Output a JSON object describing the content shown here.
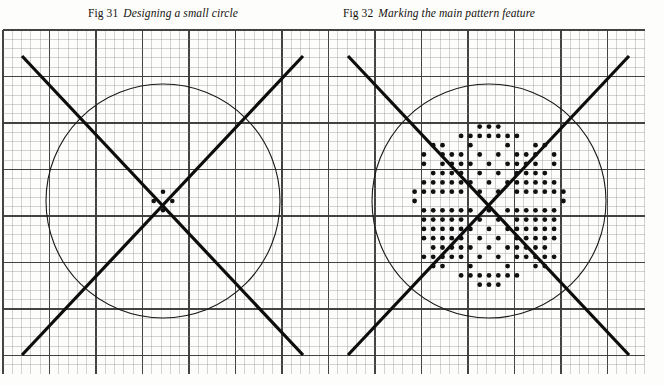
{
  "page": {
    "background_color": "#fdfdfb",
    "ink_color": "#15120f",
    "grid_line_color": "#3a3a3a",
    "grid_minor_color": "#8a8a8a",
    "circle_color": "#1a1a1a",
    "dot_color": "#101010",
    "diagonal_color": "#0d0d0d"
  },
  "captions": [
    {
      "id": "fig31",
      "label": "Fig 31",
      "title": "Designing a small circle"
    },
    {
      "id": "fig32",
      "label": "Fig 32",
      "title": "Marking the main pattern feature"
    }
  ],
  "grid": {
    "origin_x": 3,
    "origin_y": 8,
    "cell": 9.3,
    "cols": 69,
    "rows": 39,
    "major_every": 5,
    "minor_width": 0.5,
    "major_width": 1.15
  },
  "figures": [
    {
      "name": "fig31-small-circle",
      "center_x": 163,
      "center_y": 179,
      "circle_radius": 117,
      "circle_stroke": 1.1,
      "diagonals": [
        {
          "x1": 22,
          "y1": 34,
          "x2": 303,
          "y2": 333
        },
        {
          "x1": 303,
          "y1": 34,
          "x2": 22,
          "y2": 333
        }
      ],
      "diagonal_width": 3.2,
      "center_dots": [
        {
          "dx": 0,
          "dy": -9.3
        },
        {
          "dx": 0,
          "dy": 9.3
        },
        {
          "dx": -9.3,
          "dy": 0
        },
        {
          "dx": 9.3,
          "dy": 0
        }
      ],
      "dot_radius": 2.3
    },
    {
      "name": "fig32-main-pattern",
      "center_x": 489,
      "center_y": 179,
      "circle_radius": 117,
      "circle_stroke": 1.1,
      "diagonals": [
        {
          "x1": 348,
          "y1": 34,
          "x2": 629,
          "y2": 333
        },
        {
          "x1": 629,
          "y1": 34,
          "x2": 348,
          "y2": 333
        }
      ],
      "diagonal_width": 3.2,
      "dot_radius": 2.4,
      "pattern_dots_grid": [
        [
          0,
          -8
        ],
        [
          1,
          -8
        ],
        [
          -1,
          -7
        ],
        [
          0,
          -7
        ],
        [
          2,
          -7
        ],
        [
          3,
          -7
        ],
        [
          -2,
          -6
        ],
        [
          -6,
          -6
        ],
        [
          5,
          -6
        ],
        [
          6,
          -6
        ],
        [
          -3,
          -5
        ],
        [
          -1,
          -5
        ],
        [
          1,
          -5
        ],
        [
          4,
          -5
        ],
        [
          7,
          -5
        ],
        [
          -5,
          -5
        ],
        [
          -4,
          -4
        ],
        [
          -2,
          -4
        ],
        [
          0,
          -4
        ],
        [
          2,
          -4
        ],
        [
          3,
          -4
        ],
        [
          5,
          -4
        ],
        [
          7,
          -4
        ],
        [
          -7,
          -4
        ],
        [
          -5,
          -3
        ],
        [
          -3,
          -3
        ],
        [
          -1,
          -3
        ],
        [
          1,
          -3
        ],
        [
          4,
          -3
        ],
        [
          6,
          -3
        ],
        [
          -6,
          -2
        ],
        [
          -4,
          -2
        ],
        [
          -2,
          -2
        ],
        [
          0,
          -2
        ],
        [
          2,
          -2
        ],
        [
          3,
          -2
        ],
        [
          5,
          -2
        ],
        [
          7,
          -2
        ],
        [
          -7,
          -1
        ],
        [
          -5,
          -1
        ],
        [
          -3,
          -1
        ],
        [
          -1,
          -1
        ],
        [
          1,
          -1
        ],
        [
          4,
          -1
        ],
        [
          6,
          -1
        ],
        [
          -8,
          0
        ],
        [
          -8,
          -1
        ],
        [
          8,
          0
        ],
        [
          8,
          -1
        ],
        [
          -6,
          1
        ],
        [
          -4,
          1
        ],
        [
          -2,
          1
        ],
        [
          0,
          1
        ],
        [
          2,
          1
        ],
        [
          3,
          1
        ],
        [
          5,
          1
        ],
        [
          7,
          1
        ],
        [
          -7,
          2
        ],
        [
          -5,
          2
        ],
        [
          -3,
          2
        ],
        [
          -1,
          2
        ],
        [
          1,
          2
        ],
        [
          4,
          2
        ],
        [
          6,
          2
        ],
        [
          -6,
          3
        ],
        [
          -4,
          3
        ],
        [
          -2,
          3
        ],
        [
          0,
          3
        ],
        [
          2,
          3
        ],
        [
          3,
          3
        ],
        [
          5,
          3
        ],
        [
          7,
          3
        ],
        [
          -7,
          4
        ],
        [
          -5,
          4
        ],
        [
          -3,
          4
        ],
        [
          -1,
          4
        ],
        [
          1,
          4
        ],
        [
          4,
          4
        ],
        [
          6,
          4
        ],
        [
          -6,
          5
        ],
        [
          -4,
          5
        ],
        [
          -2,
          5
        ],
        [
          0,
          5
        ],
        [
          2,
          5
        ],
        [
          3,
          5
        ],
        [
          5,
          5
        ],
        [
          -5,
          6
        ],
        [
          -3,
          6
        ],
        [
          1,
          6
        ],
        [
          4,
          6
        ],
        [
          7,
          6
        ],
        [
          6,
          6
        ],
        [
          -2,
          7
        ],
        [
          -6,
          7
        ],
        [
          5,
          7
        ],
        [
          -1,
          8
        ],
        [
          0,
          8
        ],
        [
          2,
          8
        ],
        [
          3,
          8
        ],
        [
          0,
          9
        ],
        [
          1,
          9
        ]
      ]
    }
  ]
}
